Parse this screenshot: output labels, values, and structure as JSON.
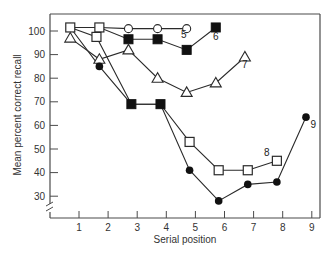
{
  "chart_data": {
    "type": "line",
    "title": "",
    "xlabel": "Serial position",
    "ylabel": "Mean percent correct recall",
    "xlim": [
      0,
      9.3
    ],
    "ylim": [
      24,
      104
    ],
    "x_ticks": [
      1,
      2,
      3,
      4,
      5,
      6,
      7,
      8,
      9
    ],
    "y_ticks": [
      30,
      40,
      50,
      60,
      70,
      80,
      90,
      100
    ],
    "y_axis_break": true,
    "grid": false,
    "legend": "inline numeric labels at end of each series",
    "series": [
      {
        "name": "5",
        "label": "5",
        "points": [
          {
            "x": 0.7,
            "y": 101.5,
            "marker": "open-square"
          },
          {
            "x": 1.7,
            "y": 101.5,
            "marker": "open-square"
          },
          {
            "x": 2.7,
            "y": 101,
            "marker": "open-circle"
          },
          {
            "x": 3.7,
            "y": 101,
            "marker": "open-circle"
          },
          {
            "x": 4.7,
            "y": 101,
            "marker": "open-circle"
          }
        ],
        "label_pos": {
          "x": 4.6,
          "y": 97
        }
      },
      {
        "name": "6",
        "label": "6",
        "points": [
          {
            "x": 0.7,
            "y": 101.5,
            "marker": "open-square"
          },
          {
            "x": 1.7,
            "y": 101.5,
            "marker": "open-square"
          },
          {
            "x": 2.7,
            "y": 96.5,
            "marker": "filled-square"
          },
          {
            "x": 3.7,
            "y": 96.5,
            "marker": "filled-square"
          },
          {
            "x": 4.7,
            "y": 92,
            "marker": "filled-square"
          },
          {
            "x": 5.7,
            "y": 101.5,
            "marker": "filled-square"
          }
        ],
        "label_pos": {
          "x": 5.7,
          "y": 96
        }
      },
      {
        "name": "7",
        "label": "7",
        "points": [
          {
            "x": 0.7,
            "y": 97,
            "marker": "open-triangle"
          },
          {
            "x": 1.7,
            "y": 88,
            "marker": "open-triangle"
          },
          {
            "x": 2.7,
            "y": 92,
            "marker": "open-triangle"
          },
          {
            "x": 3.7,
            "y": 80,
            "marker": "open-triangle"
          },
          {
            "x": 4.7,
            "y": 74,
            "marker": "open-triangle"
          },
          {
            "x": 5.7,
            "y": 78,
            "marker": "open-triangle"
          },
          {
            "x": 6.7,
            "y": 89,
            "marker": "open-triangle"
          }
        ],
        "label_pos": {
          "x": 6.7,
          "y": 84.5
        }
      },
      {
        "name": "8",
        "label": "8",
        "points": [
          {
            "x": 0.7,
            "y": 101.5,
            "marker": "open-square"
          },
          {
            "x": 1.6,
            "y": 97.5,
            "marker": "open-square"
          },
          {
            "x": 2.8,
            "y": 69,
            "marker": "filled-square"
          },
          {
            "x": 3.8,
            "y": 69,
            "marker": "filled-square"
          },
          {
            "x": 4.8,
            "y": 53,
            "marker": "open-square"
          },
          {
            "x": 5.8,
            "y": 41,
            "marker": "open-square"
          },
          {
            "x": 6.8,
            "y": 41,
            "marker": "open-square"
          },
          {
            "x": 7.8,
            "y": 45,
            "marker": "open-square"
          }
        ],
        "label_pos": {
          "x": 7.45,
          "y": 47
        }
      },
      {
        "name": "9",
        "label": "9",
        "points": [
          {
            "x": 0.7,
            "y": 101.5,
            "marker": "open-square"
          },
          {
            "x": 1.7,
            "y": 85,
            "marker": "filled-circle"
          },
          {
            "x": 2.8,
            "y": 69,
            "marker": "filled-square"
          },
          {
            "x": 3.8,
            "y": 69,
            "marker": "filled-square"
          },
          {
            "x": 4.8,
            "y": 41,
            "marker": "filled-circle"
          },
          {
            "x": 5.8,
            "y": 28,
            "marker": "filled-circle"
          },
          {
            "x": 6.8,
            "y": 35,
            "marker": "filled-circle"
          },
          {
            "x": 7.8,
            "y": 36,
            "marker": "filled-circle"
          },
          {
            "x": 8.8,
            "y": 63.5,
            "marker": "filled-circle"
          }
        ],
        "label_pos": {
          "x": 9.05,
          "y": 59
        }
      }
    ]
  },
  "axes": {
    "xlabel": "Serial position",
    "ylabel": "Mean percent correct recall"
  },
  "colors": {
    "line": "#2a2a2a",
    "frame": "#4a4a4a",
    "marker_fill": "#111111",
    "background": "#ffffff"
  }
}
